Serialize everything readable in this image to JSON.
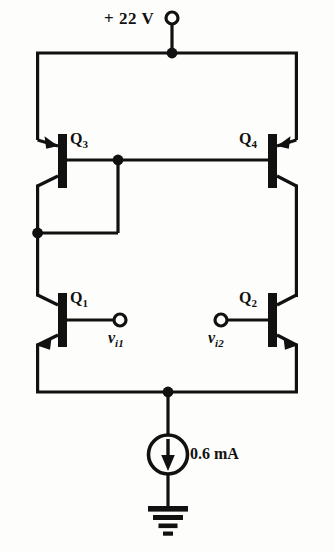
{
  "figure": {
    "type": "schematic"
  },
  "supply": {
    "label": "+ 22 V",
    "terminal": "open-circle-terminal"
  },
  "transistors": [
    {
      "id": "Q3",
      "name": "Q",
      "index": "3",
      "type": "pnp",
      "mirrored": false
    },
    {
      "id": "Q4",
      "name": "Q",
      "index": "4",
      "type": "pnp",
      "mirrored": true
    },
    {
      "id": "Q1",
      "name": "Q",
      "index": "1",
      "type": "npn",
      "mirrored": false
    },
    {
      "id": "Q2",
      "name": "Q",
      "index": "2",
      "type": "npn",
      "mirrored": true
    }
  ],
  "inputs": [
    {
      "id": "vi1",
      "name": "v",
      "index": "i1",
      "terminal": "open-circle-terminal"
    },
    {
      "id": "vi2",
      "name": "v",
      "index": "i2",
      "terminal": "open-circle-terminal"
    }
  ],
  "current_source": {
    "label": "0.6 mA",
    "direction": "down",
    "symbol": "circle-arrow-current-source"
  },
  "ground": {
    "symbol": "earth-ground-icon"
  },
  "colors": {
    "wire": "#111111",
    "background": "#fdfdfb",
    "text": "#111111"
  }
}
